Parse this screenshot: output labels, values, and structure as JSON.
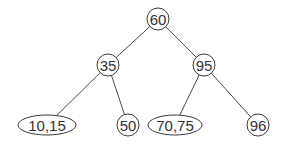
{
  "diagram": {
    "type": "tree",
    "title": "",
    "nodes": [
      {
        "id": "n60",
        "label": "60",
        "shape": "circle",
        "cx": 158,
        "cy": 19,
        "rx": 11,
        "ry": 11
      },
      {
        "id": "n35",
        "label": "35",
        "shape": "circle",
        "cx": 108,
        "cy": 65,
        "rx": 11,
        "ry": 11
      },
      {
        "id": "n95",
        "label": "95",
        "shape": "circle",
        "cx": 204,
        "cy": 65,
        "rx": 11,
        "ry": 11
      },
      {
        "id": "n1015",
        "label": "10,15",
        "shape": "ellipse",
        "cx": 47,
        "cy": 125,
        "rx": 29,
        "ry": 10
      },
      {
        "id": "n50",
        "label": "50",
        "shape": "circle",
        "cx": 128,
        "cy": 125,
        "rx": 11,
        "ry": 11
      },
      {
        "id": "n7075",
        "label": "70,75",
        "shape": "ellipse",
        "cx": 175,
        "cy": 125,
        "rx": 27,
        "ry": 10
      },
      {
        "id": "n96",
        "label": "96",
        "shape": "circle",
        "cx": 258,
        "cy": 125,
        "rx": 11,
        "ry": 11
      }
    ],
    "edges": [
      {
        "from": "n60",
        "to": "n35"
      },
      {
        "from": "n60",
        "to": "n95"
      },
      {
        "from": "n35",
        "to": "n1015"
      },
      {
        "from": "n35",
        "to": "n50"
      },
      {
        "from": "n95",
        "to": "n7075"
      },
      {
        "from": "n95",
        "to": "n96"
      }
    ]
  }
}
